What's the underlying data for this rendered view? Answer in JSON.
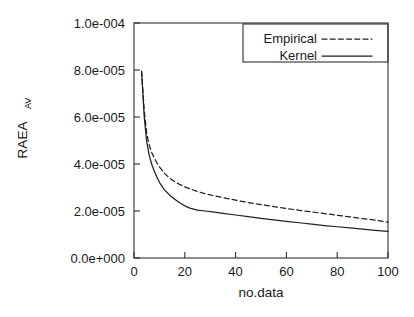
{
  "chart_data": {
    "type": "line",
    "title": "",
    "xlabel": "no.data",
    "ylabel": "RAEA",
    "ylabel_subscript": "AV",
    "xlim": [
      0,
      100
    ],
    "ylim": [
      0.0,
      0.0001
    ],
    "grid": false,
    "legend_position": "top-right",
    "xticks": [
      0,
      20,
      40,
      60,
      80,
      100
    ],
    "xtick_labels": [
      "0",
      "20",
      "40",
      "60",
      "80",
      "100"
    ],
    "yticks": [
      0.0,
      2e-05,
      4e-05,
      6e-05,
      8e-05,
      0.0001
    ],
    "ytick_labels": [
      "0.0e+000",
      "2.0e-005",
      "4.0e-005",
      "6.0e-005",
      "8.0e-005",
      "1.0e-004"
    ],
    "series": [
      {
        "name": "Empirical",
        "style": "dashed",
        "color": "#202020",
        "x": [
          3,
          4,
          5,
          6,
          7,
          8,
          9,
          10,
          12,
          14,
          16,
          18,
          20,
          22,
          25,
          28,
          31,
          35,
          40,
          45,
          50,
          55,
          60,
          65,
          70,
          75,
          80,
          85,
          90,
          95,
          100
        ],
        "y": [
          7.95e-05,
          6.3e-05,
          5.3e-05,
          4.8e-05,
          4.48e-05,
          4.25e-05,
          4.05e-05,
          3.88e-05,
          3.6e-05,
          3.4e-05,
          3.25e-05,
          3.13e-05,
          3.03e-05,
          2.94e-05,
          2.83e-05,
          2.74e-05,
          2.66e-05,
          2.57e-05,
          2.46e-05,
          2.36e-05,
          2.27e-05,
          2.19e-05,
          2.11e-05,
          2.03e-05,
          1.96e-05,
          1.89e-05,
          1.82e-05,
          1.75e-05,
          1.68e-05,
          1.61e-05,
          1.53e-05
        ]
      },
      {
        "name": "Kernel",
        "style": "solid",
        "color": "#202020",
        "x": [
          3,
          4,
          5,
          6,
          7,
          8,
          9,
          10,
          12,
          14,
          16,
          18,
          20,
          22,
          25,
          28,
          31,
          35,
          40,
          45,
          50,
          55,
          60,
          65,
          70,
          75,
          80,
          85,
          90,
          95,
          100
        ],
        "y": [
          7.9e-05,
          6.05e-05,
          4.95e-05,
          4.37e-05,
          3.98e-05,
          3.7e-05,
          3.45e-05,
          3.22e-05,
          2.9e-05,
          2.68e-05,
          2.5e-05,
          2.35e-05,
          2.22e-05,
          2.12e-05,
          2.04e-05,
          2e-05,
          1.96e-05,
          1.9e-05,
          1.83e-05,
          1.76e-05,
          1.69e-05,
          1.62e-05,
          1.56e-05,
          1.5e-05,
          1.44e-05,
          1.38e-05,
          1.33e-05,
          1.28e-05,
          1.23e-05,
          1.18e-05,
          1.13e-05
        ]
      }
    ]
  },
  "legend": {
    "entries": [
      {
        "label": "Empirical",
        "style": "dashed"
      },
      {
        "label": "Kernel",
        "style": "solid"
      }
    ]
  },
  "axes": {
    "x_title": "no.data",
    "y_title": "RAEA",
    "y_title_sub": "AV"
  }
}
